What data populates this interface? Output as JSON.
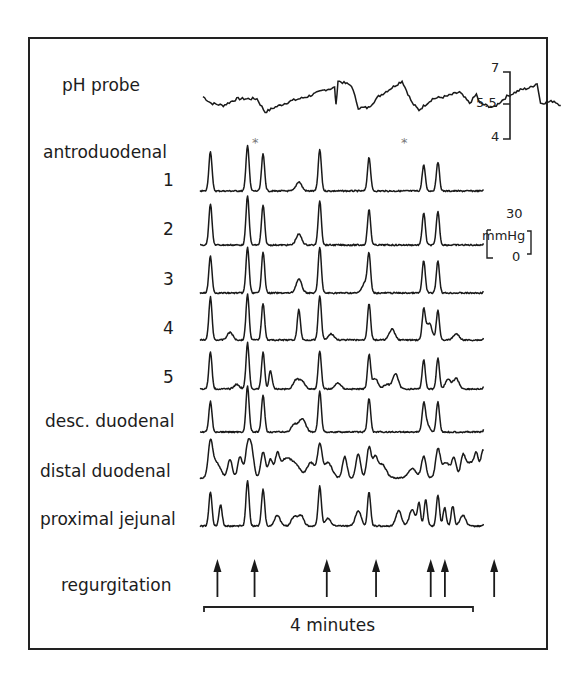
{
  "figure": {
    "labels": {
      "ph_probe": "pH probe",
      "antroduodenal": "antroduodenal",
      "ch1": "1",
      "ch2": "2",
      "ch3": "3",
      "ch4": "4",
      "ch5": "5",
      "desc_duodenal": "desc. duodenal",
      "distal_duodenal": "distal duodenal",
      "proximal_jejunal": "proximal jejunal",
      "regurgitation": "regurgitation",
      "time_bar": "4 minutes"
    },
    "ph_scale": {
      "top": "7",
      "mid": "5.5",
      "bottom": "4"
    },
    "pressure_scale": {
      "top": "30",
      "unit": "mmHg",
      "bottom": "0"
    },
    "asterisk": "*",
    "colors": {
      "trace": "#1a1a1a",
      "frame": "#222222",
      "background": "#ffffff",
      "asterisk": "#777777"
    }
  },
  "chart_data": {
    "type": "line",
    "title": "",
    "x_span_label": "4 minutes",
    "x_range_minutes": [
      0,
      4
    ],
    "ph": {
      "name": "pH probe",
      "ylim": [
        4,
        7
      ],
      "ticks": [
        7,
        5.5,
        4
      ],
      "points_minutes_ph": [
        [
          0.0,
          5.9
        ],
        [
          0.12,
          5.6
        ],
        [
          0.3,
          5.5
        ],
        [
          0.5,
          5.8
        ],
        [
          0.65,
          5.8
        ],
        [
          0.8,
          5.8
        ],
        [
          0.92,
          5.2
        ],
        [
          1.05,
          5.4
        ],
        [
          1.3,
          5.7
        ],
        [
          1.55,
          5.9
        ],
        [
          1.8,
          6.2
        ],
        [
          1.95,
          6.3
        ],
        [
          1.97,
          5.5
        ],
        [
          2.0,
          6.6
        ],
        [
          2.2,
          6.4
        ],
        [
          2.3,
          5.4
        ],
        [
          2.45,
          5.4
        ],
        [
          2.6,
          5.9
        ],
        [
          2.8,
          6.3
        ],
        [
          2.95,
          6.6
        ],
        [
          3.1,
          5.6
        ],
        [
          3.2,
          5.3
        ],
        [
          3.4,
          5.8
        ],
        [
          3.6,
          5.9
        ],
        [
          3.8,
          6.1
        ],
        [
          3.95,
          5.6
        ],
        [
          4.05,
          6.0
        ],
        [
          4.1,
          5.6
        ],
        [
          4.3,
          5.4
        ],
        [
          4.5,
          5.9
        ],
        [
          4.7,
          6.2
        ],
        [
          4.85,
          6.3
        ],
        [
          4.95,
          6.5
        ],
        [
          5.0,
          5.6
        ],
        [
          5.2,
          5.7
        ],
        [
          5.3,
          5.5
        ]
      ]
    },
    "pressure_ylim_mmHg": [
      0,
      30
    ],
    "pressure_channels": [
      {
        "name": "antroduodenal 1",
        "peaks_minutes_mmHg": [
          [
            0.11,
            26
          ],
          [
            0.66,
            30
          ],
          [
            0.89,
            24
          ],
          [
            1.42,
            6
          ],
          [
            1.73,
            27
          ],
          [
            2.46,
            22
          ],
          [
            3.27,
            17
          ],
          [
            3.48,
            19
          ],
          [
            4.21,
            22
          ]
        ]
      },
      {
        "name": "antroduodenal 2",
        "peaks_minutes_mmHg": [
          [
            0.11,
            27
          ],
          [
            0.66,
            32
          ],
          [
            0.89,
            26
          ],
          [
            1.42,
            7
          ],
          [
            1.73,
            29
          ],
          [
            2.46,
            23
          ],
          [
            3.27,
            21
          ],
          [
            3.48,
            22
          ],
          [
            4.21,
            23
          ]
        ]
      },
      {
        "name": "antroduodenal 3",
        "peaks_minutes_mmHg": [
          [
            0.11,
            24
          ],
          [
            0.66,
            30
          ],
          [
            0.89,
            27
          ],
          [
            1.42,
            9
          ],
          [
            1.73,
            30
          ],
          [
            2.4,
            7
          ],
          [
            2.46,
            24
          ],
          [
            3.27,
            21
          ],
          [
            3.48,
            21
          ],
          [
            4.21,
            23
          ]
        ]
      },
      {
        "name": "antroduodenal 4",
        "peaks_minutes_mmHg": [
          [
            0.11,
            28
          ],
          [
            0.4,
            5
          ],
          [
            0.66,
            30
          ],
          [
            0.89,
            24
          ],
          [
            1.42,
            20
          ],
          [
            1.73,
            29
          ],
          [
            1.9,
            4
          ],
          [
            2.46,
            24
          ],
          [
            2.8,
            7
          ],
          [
            3.27,
            19
          ],
          [
            3.35,
            11
          ],
          [
            3.48,
            19
          ],
          [
            3.75,
            4
          ],
          [
            4.21,
            26
          ],
          [
            4.3,
            10
          ]
        ]
      },
      {
        "name": "antroduodenal 5",
        "peaks_minutes_mmHg": [
          [
            0.11,
            24
          ],
          [
            0.5,
            3
          ],
          [
            0.66,
            30
          ],
          [
            0.89,
            24
          ],
          [
            1.0,
            12
          ],
          [
            1.38,
            6
          ],
          [
            1.47,
            5
          ],
          [
            1.73,
            25
          ],
          [
            2.0,
            4
          ],
          [
            2.46,
            22
          ],
          [
            2.55,
            7
          ],
          [
            2.72,
            3
          ],
          [
            2.85,
            10
          ],
          [
            3.27,
            19
          ],
          [
            3.48,
            20
          ],
          [
            3.63,
            6
          ],
          [
            3.75,
            7
          ],
          [
            4.21,
            20
          ],
          [
            4.35,
            18
          ]
        ]
      },
      {
        "name": "desc. duodenal",
        "peaks_minutes_mmHg": [
          [
            0.11,
            20
          ],
          [
            0.66,
            30
          ],
          [
            0.89,
            24
          ],
          [
            1.35,
            5
          ],
          [
            1.45,
            6
          ],
          [
            1.5,
            4
          ],
          [
            1.73,
            27
          ],
          [
            2.46,
            22
          ],
          [
            3.27,
            14
          ],
          [
            3.3,
            7
          ],
          [
            3.48,
            20
          ],
          [
            4.21,
            22
          ],
          [
            4.3,
            9
          ]
        ]
      },
      {
        "name": "distal duodenal",
        "peaks_minutes_mmHg": [
          [
            0.11,
            22
          ],
          [
            0.2,
            10
          ],
          [
            0.4,
            12
          ],
          [
            0.55,
            14
          ],
          [
            0.66,
            20
          ],
          [
            0.72,
            18
          ],
          [
            0.89,
            17
          ],
          [
            1.0,
            12
          ],
          [
            1.1,
            14
          ],
          [
            1.2,
            10
          ],
          [
            1.3,
            8
          ],
          [
            1.4,
            6
          ],
          [
            1.6,
            10
          ],
          [
            1.73,
            20
          ],
          [
            1.85,
            10
          ],
          [
            2.1,
            14
          ],
          [
            2.3,
            16
          ],
          [
            2.46,
            20
          ],
          [
            2.55,
            12
          ],
          [
            2.65,
            9
          ],
          [
            3.1,
            6
          ],
          [
            3.27,
            14
          ],
          [
            3.48,
            18
          ],
          [
            3.6,
            10
          ],
          [
            3.72,
            12
          ],
          [
            3.85,
            13
          ],
          [
            3.95,
            10
          ],
          [
            4.05,
            14
          ],
          [
            4.15,
            18
          ],
          [
            4.25,
            16
          ],
          [
            4.35,
            12
          ]
        ]
      },
      {
        "name": "proximal jejunal",
        "peaks_minutes_mmHg": [
          [
            0.11,
            22
          ],
          [
            0.26,
            14
          ],
          [
            0.66,
            30
          ],
          [
            0.89,
            24
          ],
          [
            1.1,
            7
          ],
          [
            1.35,
            6
          ],
          [
            1.45,
            7
          ],
          [
            1.73,
            26
          ],
          [
            1.85,
            5
          ],
          [
            2.3,
            10
          ],
          [
            2.46,
            22
          ],
          [
            2.9,
            10
          ],
          [
            3.1,
            11
          ],
          [
            3.2,
            15
          ],
          [
            3.3,
            17
          ],
          [
            3.48,
            20
          ],
          [
            3.58,
            12
          ],
          [
            3.7,
            13
          ],
          [
            3.85,
            7
          ],
          [
            4.21,
            21
          ]
        ]
      }
    ],
    "annotations": [
      {
        "type": "asterisk",
        "channel": "antroduodenal 1",
        "x_minutes": 0.89
      },
      {
        "type": "asterisk",
        "channel": "antroduodenal 1",
        "x_minutes": 3.27
      }
    ],
    "regurgitation_events_minutes": [
      0.11,
      0.66,
      1.73,
      2.46,
      3.27,
      3.48,
      4.21
    ]
  }
}
